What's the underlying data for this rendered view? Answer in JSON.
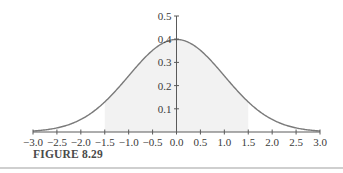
{
  "figure": {
    "caption": "FIGURE 8.29"
  },
  "chart_data": {
    "type": "area",
    "title": "",
    "xlabel": "",
    "ylabel": "",
    "xlim": [
      -3.0,
      3.0
    ],
    "ylim": [
      0,
      0.5
    ],
    "grid": false,
    "legend": null,
    "x_ticks": [
      "-3.0",
      "-2.5",
      "-2.0",
      "-1.5",
      "-1.0",
      "-0.5",
      "0.0",
      "0.5",
      "1.0",
      "1.5",
      "2.0",
      "2.5",
      "3.0"
    ],
    "y_ticks": [
      "0.1",
      "0.2",
      "0.3",
      "0.4",
      "0.5"
    ],
    "series": [
      {
        "name": "normal pdf",
        "x": [
          -3.0,
          -2.5,
          -2.0,
          -1.5,
          -1.0,
          -0.5,
          0.0,
          0.5,
          1.0,
          1.5,
          2.0,
          2.5,
          3.0
        ],
        "values": [
          0.004,
          0.018,
          0.054,
          0.13,
          0.242,
          0.352,
          0.399,
          0.352,
          0.242,
          0.13,
          0.054,
          0.018,
          0.004
        ]
      }
    ],
    "shaded_region": {
      "from": -1.5,
      "to": 1.5
    },
    "colors": {
      "curve": "#7a7a7a",
      "axis": "#5a5a5a",
      "shade": "#f2f2f2"
    }
  }
}
